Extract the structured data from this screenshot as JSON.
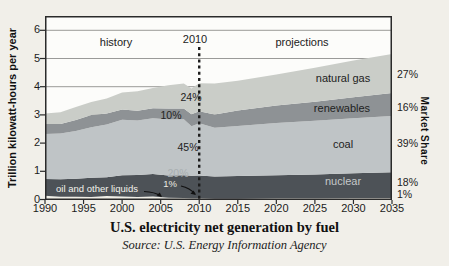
{
  "figure": {
    "title": "U.S. electricity net generation by fuel",
    "source": "Source: U.S. Energy Information Agency",
    "y_axis_title": "Trillion kilowatt-hours per year",
    "right_axis_title": "Market Share",
    "annotations": {
      "history": "history",
      "divider_year": "2010",
      "projections": "projections",
      "oil_label": "oil and other liquids"
    },
    "band_labels": {
      "natural_gas": "natural gas",
      "renewables": "renewables",
      "coal": "coal",
      "nuclear": "nuclear"
    },
    "shares_2010": {
      "natural_gas": "24%",
      "renewables": "10%",
      "coal": "45%",
      "nuclear": "20%",
      "oil": "1%"
    },
    "shares_2035": {
      "natural_gas": "27%",
      "renewables": "16%",
      "coal": "39%",
      "nuclear": "18%",
      "oil": "1%"
    }
  },
  "chart_data": {
    "type": "area",
    "stacked": true,
    "title": "U.S. electricity net generation by fuel",
    "xlabel": "",
    "ylabel": "Trillion kilowatt-hours per year",
    "right_ylabel": "Market Share",
    "xlim": [
      1990,
      2035
    ],
    "ylim": [
      0,
      6.5
    ],
    "grid": true,
    "x_ticks": [
      1990,
      1995,
      2000,
      2005,
      2010,
      2015,
      2020,
      2025,
      2030,
      2035
    ],
    "y_ticks": [
      0,
      1,
      2,
      3,
      4,
      5,
      6
    ],
    "divider_x": 2010,
    "x": [
      1990,
      1992,
      1994,
      1996,
      1998,
      2000,
      2002,
      2004,
      2006,
      2008,
      2009,
      2010,
      2012,
      2015,
      2020,
      2025,
      2030,
      2035
    ],
    "series": [
      {
        "name": "oil and other liquids",
        "color": "#efeee6",
        "values": [
          0.13,
          0.1,
          0.1,
          0.09,
          0.12,
          0.11,
          0.09,
          0.11,
          0.06,
          0.05,
          0.04,
          0.04,
          0.03,
          0.03,
          0.04,
          0.04,
          0.05,
          0.05
        ],
        "share_2010": 1,
        "share_2035": 1
      },
      {
        "name": "nuclear",
        "color": "#4d5257",
        "values": [
          0.6,
          0.62,
          0.64,
          0.68,
          0.67,
          0.75,
          0.78,
          0.79,
          0.79,
          0.81,
          0.8,
          0.81,
          0.79,
          0.8,
          0.82,
          0.85,
          0.88,
          0.92
        ],
        "share_2010": 20,
        "share_2035": 18
      },
      {
        "name": "coal",
        "color": "#bfc4c6",
        "values": [
          1.59,
          1.62,
          1.69,
          1.79,
          1.87,
          1.97,
          1.93,
          1.98,
          1.99,
          1.99,
          1.76,
          1.85,
          1.72,
          1.78,
          1.85,
          1.9,
          1.95,
          1.99
        ],
        "share_2010": 45,
        "share_2035": 39
      },
      {
        "name": "renewables",
        "color": "#8e9295",
        "values": [
          0.36,
          0.34,
          0.39,
          0.44,
          0.39,
          0.36,
          0.35,
          0.36,
          0.39,
          0.38,
          0.42,
          0.43,
          0.47,
          0.55,
          0.62,
          0.68,
          0.75,
          0.82
        ],
        "share_2010": 10,
        "share_2035": 16
      },
      {
        "name": "natural gas",
        "color": "#cacdc8",
        "values": [
          0.37,
          0.41,
          0.46,
          0.46,
          0.53,
          0.6,
          0.69,
          0.71,
          0.82,
          0.88,
          0.92,
          0.99,
          1.1,
          1.05,
          1.1,
          1.2,
          1.3,
          1.38
        ],
        "share_2010": 24,
        "share_2035": 27
      }
    ]
  },
  "colors": {
    "background": "#f1efe9",
    "plot_background": "#fcfcfa",
    "grid": "#9a9a98",
    "border": "#2a2a2a",
    "divider": "#1c1c1c",
    "natural_gas": "#cacdc8",
    "renewables": "#8e9295",
    "coal": "#bfc4c6",
    "nuclear": "#4d5257",
    "oil": "#efeee6"
  }
}
